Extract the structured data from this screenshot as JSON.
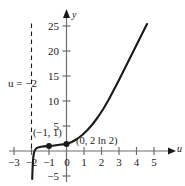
{
  "chart_data": {
    "type": "line",
    "title": "",
    "xlabel": "u",
    "ylabel": "y",
    "xlim": [
      -3.4,
      5.6
    ],
    "ylim": [
      -6,
      26
    ],
    "grid": false,
    "legend": null,
    "x_ticks": [
      -3,
      -2,
      -1,
      0,
      1,
      2,
      3,
      4,
      5
    ],
    "x_tick_labels": [
      "−3",
      "−2",
      "−1",
      "0",
      "1",
      "2",
      "3",
      "4",
      "5"
    ],
    "y_ticks": [
      -5,
      5,
      10,
      15,
      20,
      25
    ],
    "y_tick_labels": [
      "−5",
      "5",
      "10",
      "15",
      "20",
      "25"
    ],
    "series": [
      {
        "name": "curve",
        "color": "#1a1a1a",
        "points": [
          [
            -1.96,
            -5.6
          ],
          [
            -1.94,
            -3.6
          ],
          [
            -1.92,
            -2.2
          ],
          [
            -1.9,
            -1.3
          ],
          [
            -1.86,
            -0.4
          ],
          [
            -1.82,
            0.05
          ],
          [
            -1.76,
            0.4
          ],
          [
            -1.68,
            0.62
          ],
          [
            -1.58,
            0.76
          ],
          [
            -1.45,
            0.86
          ],
          [
            -1.3,
            0.93
          ],
          [
            -1.15,
            0.97
          ],
          [
            -1.0,
            1.0
          ],
          [
            -0.8,
            1.05
          ],
          [
            -0.6,
            1.14
          ],
          [
            -0.4,
            1.24
          ],
          [
            -0.2,
            1.33
          ],
          [
            0.0,
            1.386
          ],
          [
            0.3,
            1.8
          ],
          [
            0.6,
            2.4
          ],
          [
            0.9,
            3.2
          ],
          [
            1.2,
            4.2
          ],
          [
            1.5,
            5.4
          ],
          [
            1.8,
            6.8
          ],
          [
            2.1,
            8.4
          ],
          [
            2.4,
            10.2
          ],
          [
            2.7,
            12.2
          ],
          [
            3.0,
            14.2
          ],
          [
            3.3,
            16.3
          ],
          [
            3.6,
            18.4
          ],
          [
            3.9,
            20.5
          ],
          [
            4.2,
            22.6
          ],
          [
            4.5,
            24.7
          ],
          [
            4.6,
            25.4
          ]
        ]
      }
    ],
    "markers": [
      {
        "name": "point-minus1-1",
        "x": -1,
        "y": 1,
        "label": "(−1, 1)"
      },
      {
        "name": "point-0-2ln2",
        "x": 0,
        "y": 1.386,
        "label": "(0, 2 ln 2)"
      }
    ],
    "asymptote": {
      "name": "vertical-asymptote",
      "x": -2,
      "style": "dashed",
      "label": "u = −2",
      "y_from": 25.5,
      "y_to": -0.2
    },
    "annotations": [
      {
        "name": "label-point-minus1-1",
        "text": "(−1, 1)"
      },
      {
        "name": "label-point-0-2ln2",
        "text": "(0, 2 ln 2)"
      },
      {
        "name": "label-asymptote",
        "text": "u = −2"
      }
    ]
  },
  "axes": {
    "x_axis_name": "u",
    "y_axis_name": "y"
  }
}
